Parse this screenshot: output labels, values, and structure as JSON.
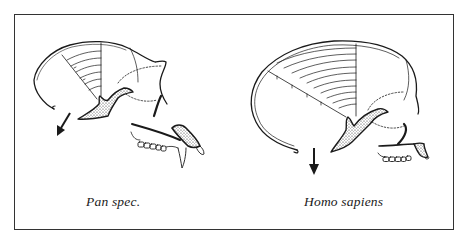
{
  "figure": {
    "panels": [
      {
        "id": "pan",
        "label": "Pan spec.",
        "arrow_direction": "down-left"
      },
      {
        "id": "homo",
        "label": "Homo sapiens",
        "arrow_direction": "down"
      }
    ],
    "colors": {
      "ink": "#1a1a1a",
      "frame": "#333333",
      "background": "#ffffff"
    }
  }
}
